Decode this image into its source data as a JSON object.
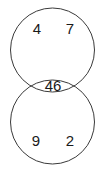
{
  "figure": {
    "type": "venn-diagram",
    "width": 106,
    "height": 173,
    "background_color": "#ffffff",
    "stroke_color": "#3a3a3a",
    "text_color": "#1a1a1a"
  },
  "sets": {
    "top_circle": {
      "name": "top-set",
      "center_x": 52.5,
      "center_y": 50,
      "radius": 42
    },
    "bottom_circle": {
      "name": "bottom-set",
      "center_x": 52.5,
      "center_y": 122,
      "radius": 42
    }
  },
  "labels": [
    {
      "id": "top-left-value",
      "text": "4",
      "x": 37,
      "y": 28,
      "region": "top-only"
    },
    {
      "id": "top-right-value",
      "text": "7",
      "x": 70,
      "y": 28,
      "region": "top-only"
    },
    {
      "id": "intersection-value",
      "text": "46",
      "x": 53,
      "y": 85,
      "region": "intersection"
    },
    {
      "id": "bottom-left-value",
      "text": "9",
      "x": 36,
      "y": 140,
      "region": "bottom-only"
    },
    {
      "id": "bottom-right-value",
      "text": "2",
      "x": 70,
      "y": 140,
      "region": "bottom-only"
    }
  ]
}
